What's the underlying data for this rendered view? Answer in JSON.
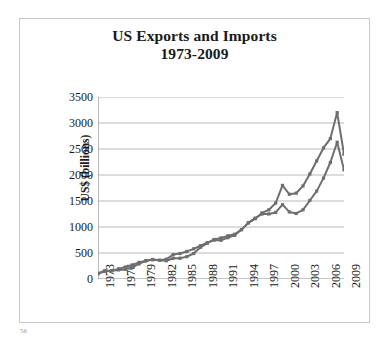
{
  "page_number": "56",
  "chart_data": {
    "type": "line",
    "title": "US Exports and Imports 1973-2009",
    "title_lines": [
      "US Exports and Imports",
      "1973-2009"
    ],
    "xlabel": "",
    "ylabel": "US$ (billions)",
    "ylim": [
      0,
      3500
    ],
    "ytick_values": [
      0,
      500,
      1000,
      1500,
      2000,
      2500,
      3000,
      3500
    ],
    "ytick_labels": [
      "0",
      "500",
      "1000",
      "1500",
      "2000",
      "2500",
      "3000",
      "3500"
    ],
    "xlim": [
      1973,
      2009
    ],
    "xtick_labels": [
      "1973",
      "1976",
      "1979",
      "1982",
      "1985",
      "1988",
      "1991",
      "1994",
      "1997",
      "2000",
      "2003",
      "2006",
      "2009"
    ],
    "xtick_values": [
      1973,
      1976,
      1979,
      1982,
      1985,
      1988,
      1991,
      1994,
      1997,
      2000,
      2003,
      2006,
      2009
    ],
    "minor_xticks_every_year": true,
    "grid": "horizontal",
    "legend": "none",
    "line_color": "#6e6e6e",
    "marker": "square",
    "x": [
      1973,
      1974,
      1975,
      1976,
      1977,
      1978,
      1979,
      1980,
      1981,
      1982,
      1983,
      1984,
      1985,
      1986,
      1987,
      1988,
      1989,
      1990,
      1991,
      1992,
      1993,
      1994,
      1995,
      1996,
      1997,
      1998,
      1999,
      2000,
      2001,
      2002,
      2003,
      2004,
      2005,
      2006,
      2007,
      2008,
      2009
    ],
    "series": [
      {
        "name": "Imports",
        "values": [
          110,
          160,
          160,
          195,
          230,
          270,
          320,
          350,
          370,
          360,
          380,
          470,
          490,
          530,
          580,
          640,
          700,
          750,
          745,
          795,
          840,
          950,
          1080,
          1160,
          1270,
          1330,
          1460,
          1800,
          1630,
          1650,
          1790,
          2020,
          2270,
          2520,
          2700,
          3200,
          2400
        ]
      },
      {
        "name": "Exports",
        "values": [
          100,
          150,
          160,
          175,
          185,
          225,
          290,
          350,
          375,
          360,
          350,
          400,
          400,
          430,
          490,
          610,
          690,
          760,
          790,
          830,
          860,
          950,
          1080,
          1170,
          1250,
          1250,
          1280,
          1430,
          1290,
          1260,
          1330,
          1510,
          1690,
          1940,
          2240,
          2630,
          2100
        ]
      }
    ]
  }
}
